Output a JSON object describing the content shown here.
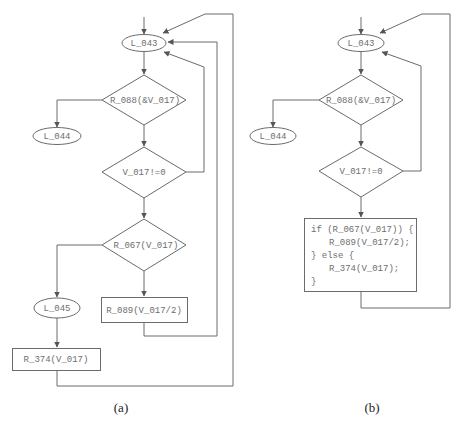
{
  "figure": {
    "panels": [
      {
        "caption": "(a)",
        "nodes": {
          "l043": "L_043",
          "r088": "R_088(&V_017)",
          "l044": "L_044",
          "v017": "V_017!=0",
          "r067": "R_067(V_017)",
          "l045": "L_045",
          "r089": "R_089(V_017/2)",
          "r374": "R_374(V_017)"
        }
      },
      {
        "caption": "(b)",
        "nodes": {
          "l043": "L_043",
          "r088": "R_088(&V_017)",
          "l044": "L_044",
          "v017": "V_017!=0",
          "code": [
            "if (R_067(V_017)) {",
            "    R_089(V_017/2);",
            "} else {",
            "    R_374(V_017);",
            "}"
          ]
        }
      }
    ]
  }
}
